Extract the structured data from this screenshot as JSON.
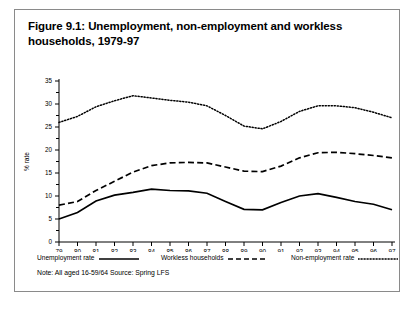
{
  "figure": {
    "title": "Figure 9.1: Unemployment, non-employment and workless households, 1979-97",
    "note": "Note: All aged 16-59/64 Source: Spring LFS",
    "border_color": "#8a8a8a",
    "background": "#ffffff",
    "ink_color": "#000000"
  },
  "legend": {
    "position": "bottom",
    "entries": [
      {
        "label": "Unemployment rate",
        "style": "solid"
      },
      {
        "label": "Workless households",
        "style": "dashed"
      },
      {
        "label": "Non-employment rate",
        "style": "dotted"
      }
    ]
  },
  "chart_data": {
    "type": "line",
    "title": "Figure 9.1: Unemployment, non-employment and workless households, 1979-97",
    "xlabel": "",
    "ylabel": "% rate",
    "x": [
      "79",
      "80",
      "81",
      "82",
      "83",
      "84",
      "85",
      "86",
      "87",
      "88",
      "89",
      "90",
      "91",
      "92",
      "93",
      "94",
      "95",
      "96",
      "97"
    ],
    "xlim": [
      0,
      18
    ],
    "ylim": [
      0,
      35
    ],
    "yticks": [
      0,
      5,
      10,
      15,
      20,
      25,
      30,
      35
    ],
    "ytick_labels": [
      "0",
      "5",
      "10",
      "15",
      "20",
      "25",
      "30",
      "35"
    ],
    "grid": false,
    "series": [
      {
        "name": "Unemployment rate",
        "style": "solid",
        "values": [
          5.0,
          6.4,
          8.9,
          10.2,
          10.8,
          11.5,
          11.2,
          11.1,
          10.6,
          8.8,
          7.1,
          7.0,
          8.6,
          10.0,
          10.5,
          9.7,
          8.8,
          8.2,
          7.0
        ]
      },
      {
        "name": "Workless households",
        "style": "dashed",
        "values": [
          8.0,
          8.8,
          11.2,
          13.2,
          15.2,
          16.6,
          17.2,
          17.3,
          17.2,
          16.3,
          15.4,
          15.3,
          16.5,
          18.3,
          19.4,
          19.5,
          19.2,
          18.8,
          18.3
        ]
      },
      {
        "name": "Non-employment rate",
        "style": "dotted",
        "values": [
          26.0,
          27.3,
          29.4,
          30.7,
          31.8,
          31.3,
          30.8,
          30.4,
          29.6,
          27.5,
          25.2,
          24.6,
          26.2,
          28.4,
          29.6,
          29.6,
          29.2,
          28.2,
          27.0
        ]
      }
    ]
  }
}
